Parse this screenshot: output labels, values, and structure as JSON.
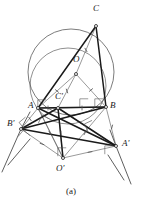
{
  "figure": {
    "caption": "(a)",
    "background_color": "#ffffff",
    "ink_color": "#1a1a1a",
    "thin_color": "#555555",
    "circle_color": "#444444"
  },
  "labels": [
    {
      "id": "C",
      "text": "C",
      "x": 93,
      "y": 4,
      "point_x": 96,
      "point_y": 26
    },
    {
      "id": "O",
      "text": "O",
      "x": 73,
      "y": 55,
      "point_x": 76,
      "point_y": 74
    },
    {
      "id": "Cp",
      "text": "C'",
      "x": 55,
      "y": 92,
      "point_x": 58,
      "point_y": 108
    },
    {
      "id": "A",
      "text": "A",
      "x": 28,
      "y": 101,
      "point_x": 38,
      "point_y": 108
    },
    {
      "id": "B",
      "text": "B",
      "x": 110,
      "y": 101,
      "point_x": 106,
      "point_y": 107
    },
    {
      "id": "Bp",
      "text": "B'",
      "x": 7,
      "y": 119,
      "point_x": 21,
      "point_y": 129
    },
    {
      "id": "Ap",
      "text": "A'",
      "x": 122,
      "y": 139,
      "point_x": 116,
      "point_y": 146
    },
    {
      "id": "Op",
      "text": "O'",
      "x": 56,
      "y": 164,
      "point_x": 63,
      "point_y": 158
    }
  ],
  "points": {
    "C": {
      "x": 96,
      "y": 26,
      "label": "C",
      "marker": "open-dot"
    },
    "O": {
      "x": 76,
      "y": 74,
      "label": "O",
      "marker": "open-dot"
    },
    "A": {
      "x": 38,
      "y": 108,
      "label": "A",
      "marker": "open-dot"
    },
    "B": {
      "x": 106,
      "y": 107,
      "label": "B",
      "marker": "open-dot"
    },
    "Cp": {
      "x": 58,
      "y": 108,
      "label": "C'",
      "marker": "open-dot"
    },
    "Bp": {
      "x": 21,
      "y": 129,
      "label": "B'",
      "marker": "open-dot"
    },
    "Ap": {
      "x": 116,
      "y": 146,
      "label": "A'",
      "marker": "open-dot"
    },
    "Op": {
      "x": 63,
      "y": 158,
      "label": "O'",
      "marker": "open-dot"
    }
  },
  "circles": [
    {
      "name": "circumcircle-ABC",
      "cx": 71,
      "cy": 72,
      "r": 43,
      "stroke_width": 0.7
    },
    {
      "name": "arc-lower-A-B",
      "cx": 68,
      "cy": 86,
      "r": 38,
      "stroke_width": 0.6
    }
  ],
  "thick_segments": [
    {
      "name": "side-CA",
      "from": "C",
      "to": "A"
    },
    {
      "name": "side-CB",
      "from": "C",
      "to": "B"
    },
    {
      "name": "side-AB",
      "from": "A",
      "to": "B"
    },
    {
      "name": "seg-Cp-Bp",
      "from": "Cp",
      "to": "Bp"
    },
    {
      "name": "seg-Cp-Ap",
      "from": "Cp",
      "to": "Ap"
    },
    {
      "name": "seg-Bp-Ap",
      "from": "Bp",
      "to": "Ap"
    },
    {
      "name": "seg-A-Ap",
      "from": "A",
      "to": "Ap"
    },
    {
      "name": "seg-B-Bp",
      "from": "B",
      "to": "Bp"
    },
    {
      "name": "seg-Cp-Op",
      "from": "Cp",
      "to": "Op"
    }
  ],
  "thin_segments": [
    {
      "name": "radius-O-A",
      "from": "O",
      "to": "A"
    },
    {
      "name": "radius-O-B",
      "from": "O",
      "to": "B"
    },
    {
      "name": "radius-O-C",
      "from": "O",
      "to": "C"
    },
    {
      "name": "seg-O-Cp",
      "from": "O",
      "to": "Cp"
    },
    {
      "name": "seg-Op-A",
      "from": "Op",
      "to": "A"
    },
    {
      "name": "seg-Op-B",
      "from": "Op",
      "to": "B"
    },
    {
      "name": "seg-Op-Ap",
      "from": "Op",
      "to": "Ap"
    },
    {
      "name": "seg-Op-Bp",
      "from": "Op",
      "to": "Bp"
    },
    {
      "name": "seg-Op-Cp",
      "from": "Op",
      "to": "Cp"
    },
    {
      "name": "seg-A-Bp",
      "from": "A",
      "to": "Bp"
    },
    {
      "name": "seg-B-Ap",
      "from": "B",
      "to": "Ap"
    },
    {
      "name": "seg-A-Op",
      "from": "A",
      "to": "Op"
    },
    {
      "name": "seg-Cp-B",
      "from": "Cp",
      "to": "B"
    },
    {
      "name": "seg-Cp-A",
      "from": "Cp",
      "to": "A"
    }
  ],
  "extension_rays": [
    {
      "name": "ray-through-Bp-down-left",
      "x1": 21,
      "y1": 129,
      "x2": 2,
      "y2": 172
    },
    {
      "name": "ray-through-Bp-up-left",
      "x1": 21,
      "y1": 129,
      "x2": 30,
      "y2": 112
    },
    {
      "name": "ray-through-Ap-down-right",
      "x1": 116,
      "y1": 146,
      "x2": 131,
      "y2": 184
    },
    {
      "name": "ray-through-Ap-up-right",
      "x1": 116,
      "y1": 146,
      "x2": 110,
      "y2": 130
    },
    {
      "name": "ray-left-lower",
      "x1": 30,
      "y1": 139,
      "x2": 8,
      "y2": 165
    },
    {
      "name": "ray-right-lower",
      "x1": 108,
      "y1": 155,
      "x2": 124,
      "y2": 180
    }
  ],
  "right_angle_markers": [
    {
      "name": "ra-at-A-on-AB",
      "x": 42,
      "y": 104,
      "rot": 0
    },
    {
      "name": "ra-at-Cp",
      "x": 84,
      "y": 103,
      "rot": 0
    },
    {
      "name": "ra-at-Bp",
      "x": 25,
      "y": 123,
      "rot": -40
    },
    {
      "name": "ra-at-Bp-2",
      "x": 24,
      "y": 136,
      "rot": 40
    },
    {
      "name": "ra-mid-left",
      "x": 44,
      "y": 121,
      "rot": 25
    },
    {
      "name": "ra-mid-right",
      "x": 90,
      "y": 126,
      "rot": -25
    },
    {
      "name": "ra-at-Op",
      "x": 62,
      "y": 152,
      "rot": 0
    },
    {
      "name": "ra-at-Ap",
      "x": 109,
      "y": 150,
      "rot": 0
    },
    {
      "name": "ra-at-B",
      "x": 99,
      "y": 103,
      "rot": 0
    }
  ],
  "tick_marks": [
    {
      "name": "tick-O-A",
      "x": 57,
      "y": 91,
      "rot": 40
    },
    {
      "name": "tick-O-B",
      "x": 91,
      "y": 90,
      "rot": -40
    },
    {
      "name": "tick-O-C",
      "x": 86,
      "y": 50,
      "rot": 60
    },
    {
      "name": "tick-O-Cp",
      "x": 67,
      "y": 91,
      "rot": 70
    },
    {
      "name": "tick-Op-A",
      "x": 50,
      "y": 133,
      "rot": 60
    },
    {
      "name": "tick-Op-B",
      "x": 85,
      "y": 133,
      "rot": -60
    },
    {
      "name": "tick-Op-Ap",
      "x": 90,
      "y": 152,
      "rot": -10
    },
    {
      "name": "tick-Op-Bp",
      "x": 42,
      "y": 144,
      "rot": 20
    },
    {
      "name": "tick-Op-Cp",
      "x": 61,
      "y": 133,
      "rot": 90
    },
    {
      "name": "tick-B-Ap",
      "x": 112,
      "y": 127,
      "rot": -75
    },
    {
      "name": "tick-A-Bp",
      "x": 30,
      "y": 119,
      "rot": 55
    },
    {
      "name": "tick-AB-l",
      "x": 48,
      "y": 108,
      "rot": 90
    },
    {
      "name": "tick-AB-r",
      "x": 82,
      "y": 108,
      "rot": 90
    }
  ]
}
